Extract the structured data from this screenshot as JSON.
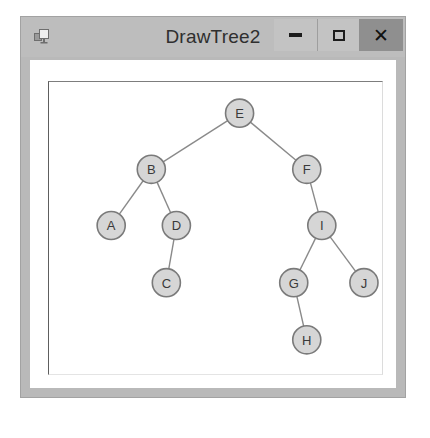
{
  "window": {
    "title": "DrawTree2",
    "icon": "form-window-icon",
    "frame_color": "#b9b9b9",
    "titlebar_color": "#bdbdbd",
    "client_color": "#ffffff",
    "buttons": [
      {
        "name": "minimize",
        "label": "—",
        "glyph": "minimize-icon",
        "background": "#c3c3c3"
      },
      {
        "name": "maximize",
        "label": "□",
        "glyph": "maximize-icon",
        "background": "#c3c3c3"
      },
      {
        "name": "close",
        "label": "×",
        "glyph": "close-icon",
        "background": "#8f8f8f"
      }
    ]
  },
  "tree": {
    "node_radius": 14,
    "node_fill": "#d6d6d6",
    "node_stroke": "#7a7a7a",
    "edge_stroke": "#8a8a8a",
    "root": "E",
    "nodes": [
      {
        "id": "E",
        "label": "E",
        "x": 190,
        "y": 31
      },
      {
        "id": "B",
        "label": "B",
        "x": 102,
        "y": 87
      },
      {
        "id": "F",
        "label": "F",
        "x": 257,
        "y": 87
      },
      {
        "id": "A",
        "label": "A",
        "x": 62,
        "y": 143
      },
      {
        "id": "D",
        "label": "D",
        "x": 127,
        "y": 143
      },
      {
        "id": "I",
        "label": "I",
        "x": 272,
        "y": 143
      },
      {
        "id": "C",
        "label": "C",
        "x": 117,
        "y": 200
      },
      {
        "id": "G",
        "label": "G",
        "x": 244,
        "y": 200
      },
      {
        "id": "J",
        "label": "J",
        "x": 314,
        "y": 200
      },
      {
        "id": "H",
        "label": "H",
        "x": 257,
        "y": 257
      }
    ],
    "edges": [
      {
        "from": "E",
        "to": "B"
      },
      {
        "from": "E",
        "to": "F"
      },
      {
        "from": "B",
        "to": "A"
      },
      {
        "from": "B",
        "to": "D"
      },
      {
        "from": "D",
        "to": "C"
      },
      {
        "from": "F",
        "to": "I"
      },
      {
        "from": "I",
        "to": "G"
      },
      {
        "from": "I",
        "to": "J"
      },
      {
        "from": "G",
        "to": "H"
      }
    ]
  }
}
